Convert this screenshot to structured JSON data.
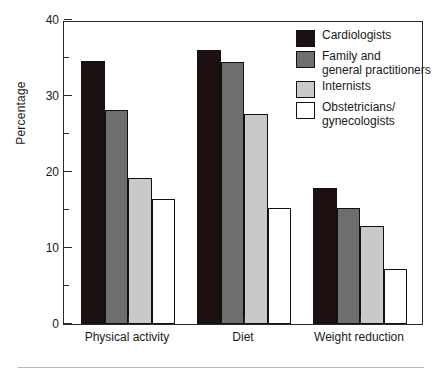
{
  "chart_data": {
    "type": "bar",
    "title": "",
    "xlabel": "",
    "ylabel": "Percentage",
    "ylim": [
      0,
      40
    ],
    "ytick_values": [
      0,
      10,
      20,
      30,
      40
    ],
    "ytick_labels": [
      "0",
      "10",
      "20",
      "30",
      "40"
    ],
    "yminor_values": [
      5,
      15,
      25,
      35
    ],
    "grid": false,
    "legend_position": "top-right",
    "categories": [
      "Physical activity",
      "Diet",
      "Weight reduction"
    ],
    "series": [
      {
        "name": "Cardiologists",
        "color": "#1c1010",
        "values": [
          34.6,
          36.0,
          17.9
        ]
      },
      {
        "name": "Family and\ngeneral practitioners",
        "color": "#6e6e6e",
        "values": [
          28.2,
          34.5,
          15.3
        ]
      },
      {
        "name": "Internists",
        "color": "#c9c9c9",
        "values": [
          19.2,
          27.6,
          12.9
        ]
      },
      {
        "name": "Obstetricians/\ngynecologists",
        "color": "#ffffff",
        "values": [
          16.5,
          15.3,
          7.2
        ]
      }
    ]
  },
  "legend": {
    "items": [
      {
        "label": "Cardiologists",
        "color": "#1c1010"
      },
      {
        "label": "Family and\ngeneral practitioners",
        "color": "#6e6e6e"
      },
      {
        "label": "Internists",
        "color": "#c9c9c9"
      },
      {
        "label": "Obstetricians/\ngynecologists",
        "color": "#ffffff"
      }
    ]
  },
  "axes": {
    "y_title": "Percentage"
  },
  "colors": {
    "axis": "#2a2a2a",
    "text": "#1a1a1a",
    "background": "#ffffff",
    "rule": "#b8b8b8"
  }
}
